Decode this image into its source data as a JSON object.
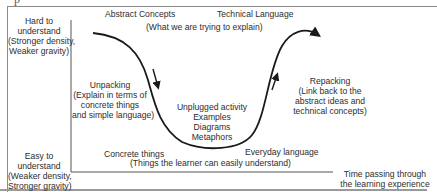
{
  "diagram": {
    "title_fragment": "p",
    "y_axis": {
      "top_label": [
        "Hard to",
        "understand",
        "(Stronger density,",
        "Weaker gravity)"
      ],
      "bottom_label": [
        "Easy to",
        "understand",
        "(Weaker density,",
        "Stronger gravity)"
      ]
    },
    "x_axis": {
      "label": [
        "Time passing through",
        "the learning experience"
      ]
    },
    "top": {
      "abstract": "Abstract Concepts",
      "technical": "Technical Language",
      "subtitle": "(What we are trying to explain)"
    },
    "unpacking": [
      "Unpacking",
      "(Explain in terms of",
      "concrete things",
      "and simple language)"
    ],
    "middle": [
      "Unplugged activity",
      "Examples",
      "Diagrams",
      "Metaphors"
    ],
    "repacking": [
      "Repacking",
      "(Link back to the",
      "abstract ideas and",
      "technical concepts)"
    ],
    "bottom": {
      "concrete": "Concrete things",
      "everyday": "Everyday language",
      "subtitle": "(Things the learner can easily understand)"
    },
    "colors": {
      "line": "#1a1a1a",
      "axis": "#555555",
      "text": "#2d2d2d"
    }
  }
}
